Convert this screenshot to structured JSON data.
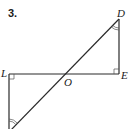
{
  "problem": {
    "number": "3."
  },
  "labels": {
    "D": "D",
    "E": "E",
    "L": "L",
    "O": "O"
  },
  "figure": {
    "points": {
      "D": [
        119,
        19
      ],
      "E": [
        119,
        74
      ],
      "L": [
        9,
        74
      ],
      "O": [
        68,
        74
      ],
      "bottom": [
        9,
        131
      ]
    },
    "segments": [
      [
        "D",
        "E"
      ],
      [
        "L",
        "E"
      ],
      [
        "D",
        "bottom"
      ],
      [
        "L",
        "bottom"
      ]
    ],
    "right_angles": [
      "L",
      "E"
    ],
    "congruent_angle_marks": [
      "D",
      "bottom"
    ],
    "colors": {
      "stroke": "#2a2a2a",
      "mark": "#555555",
      "background": "#ffffff"
    }
  }
}
